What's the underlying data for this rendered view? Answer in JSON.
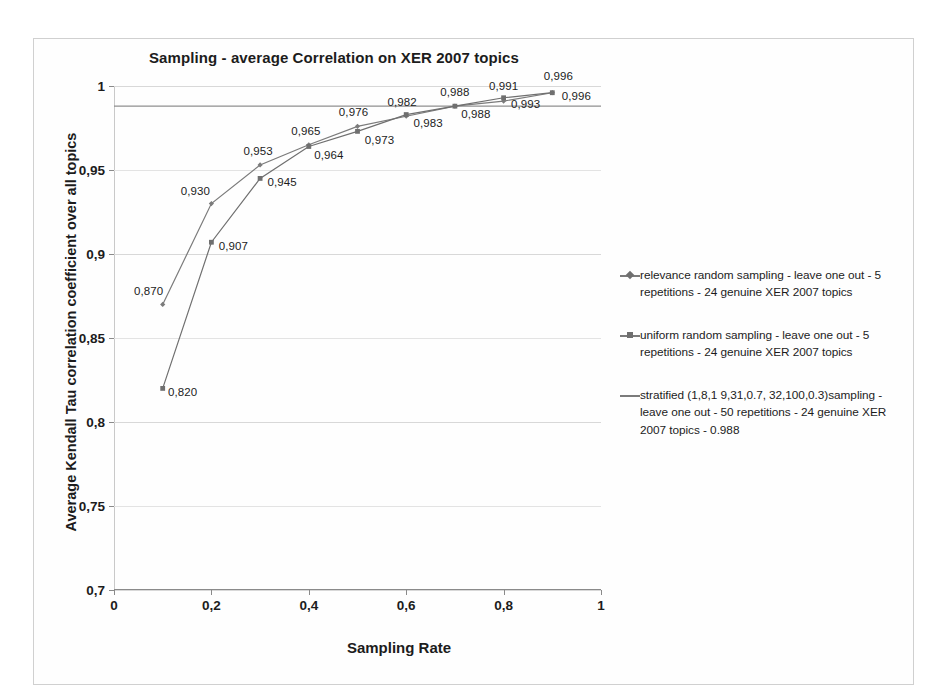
{
  "chart_data": {
    "type": "line",
    "title": "Sampling -  average Correlation on XER 2007 topics",
    "xlabel": "Sampling Rate",
    "ylabel": "Average Kendall Tau correlation coefficient over all topics",
    "xlim": [
      0,
      1
    ],
    "ylim": [
      0.7,
      1
    ],
    "grid": true,
    "legend_position": "right",
    "x_ticks": [
      "0",
      "0,2",
      "0,4",
      "0,6",
      "0,8",
      "1"
    ],
    "x_tick_values": [
      0,
      0.2,
      0.4,
      0.6,
      0.8,
      1
    ],
    "y_ticks": [
      "0,7",
      "0,75",
      "0,8",
      "0,85",
      "0,9",
      "0,95",
      "1"
    ],
    "y_tick_values": [
      0.7,
      0.75,
      0.8,
      0.85,
      0.9,
      0.95,
      1
    ],
    "x": [
      0.1,
      0.2,
      0.3,
      0.4,
      0.5,
      0.6,
      0.7,
      0.8,
      0.9
    ],
    "series": [
      {
        "name": "relevance random sampling - leave one out - 5 repetitions - 24 genuine XER 2007 topics",
        "marker": "diamond",
        "color": "#7b7b7b",
        "values": [
          0.87,
          0.93,
          0.953,
          0.965,
          0.976,
          0.982,
          0.988,
          0.991,
          0.996
        ],
        "labels": [
          "0,870",
          "0,930",
          "0,953",
          "0,965",
          "0,976",
          "0,982",
          "0,988",
          "0,991",
          "0,996"
        ]
      },
      {
        "name": "uniform random sampling - leave one out - 5 repetitions - 24 genuine XER 2007 topics",
        "marker": "square",
        "color": "#6f6f6f",
        "values": [
          0.82,
          0.907,
          0.945,
          0.964,
          0.973,
          0.983,
          0.988,
          0.993,
          0.996
        ],
        "labels": [
          "0,820",
          "0,907",
          "0,945",
          "0,964",
          "0,973",
          "0,983",
          "0,988",
          "0,993",
          "0,996"
        ]
      },
      {
        "name": "stratified (1,8,1 9,31,0.7, 32,100,0.3)sampling - leave one out - 50 repetitions - 24 genuine XER 2007 topics - 0.988",
        "marker": "none",
        "color": "#8f8f8f",
        "constant_value": 0.988
      }
    ]
  },
  "legend": {
    "entries": [
      {
        "marker": "diamond",
        "label": "relevance random sampling - leave one out - 5 repetitions - 24 genuine XER 2007 topics"
      },
      {
        "marker": "square",
        "label": "uniform random sampling - leave one out - 5 repetitions - 24 genuine XER 2007 topics"
      },
      {
        "marker": "none",
        "label": "stratified (1,8,1 9,31,0.7, 32,100,0.3)sampling - leave one out - 50 repetitions - 24 genuine XER 2007 topics - 0.988"
      }
    ]
  }
}
